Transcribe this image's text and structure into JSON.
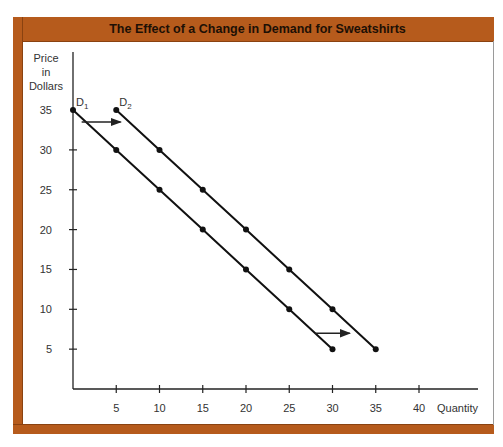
{
  "frame": {
    "accent_color": "#b65b1c"
  },
  "chart_data": {
    "type": "line",
    "title": "The Effect of a Change in Demand for Sweatshirts",
    "xlabel": "Quantity",
    "ylabel": "Price in Dollars",
    "ylabel_lines": [
      "Price",
      "in",
      "Dollars"
    ],
    "xlim": [
      0,
      40
    ],
    "ylim": [
      0,
      35
    ],
    "x_ticks": [
      5,
      10,
      15,
      20,
      25,
      30,
      35,
      40
    ],
    "y_ticks": [
      5,
      10,
      15,
      20,
      25,
      30,
      35
    ],
    "grid": false,
    "legend": "inline labels at curve tops",
    "series": [
      {
        "name": "D1",
        "label_main": "D",
        "label_sub": "1",
        "points": [
          [
            0,
            35
          ],
          [
            5,
            30
          ],
          [
            10,
            25
          ],
          [
            15,
            20
          ],
          [
            20,
            15
          ],
          [
            25,
            10
          ],
          [
            30,
            5
          ]
        ]
      },
      {
        "name": "D2",
        "label_main": "D",
        "label_sub": "2",
        "points": [
          [
            5,
            35
          ],
          [
            10,
            30
          ],
          [
            15,
            25
          ],
          [
            20,
            20
          ],
          [
            25,
            15
          ],
          [
            30,
            10
          ],
          [
            35,
            5
          ]
        ]
      }
    ],
    "annotations": [
      {
        "type": "arrow",
        "description": "rightward shift arrow near top",
        "from": [
          1,
          33.5
        ],
        "to": [
          5.5,
          33.5
        ]
      },
      {
        "type": "arrow",
        "description": "rightward shift arrow near bottom",
        "from": [
          28,
          7
        ],
        "to": [
          32,
          7
        ]
      }
    ]
  }
}
